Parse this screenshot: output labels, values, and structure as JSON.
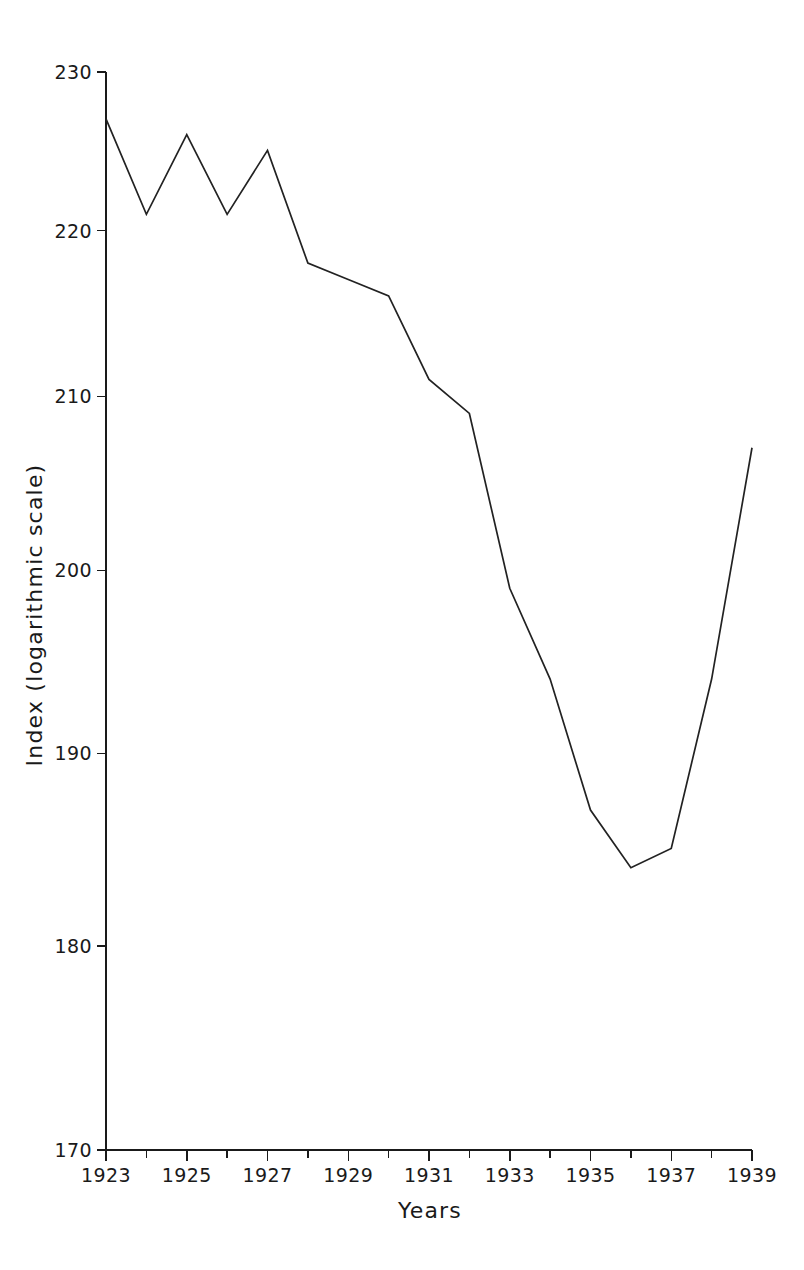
{
  "chart_data": {
    "type": "line",
    "title": "",
    "subtitle": "",
    "xlabel": "Years",
    "ylabel": "Index (logarithmic scale)",
    "yscale": "log",
    "xlim": [
      1923,
      1939
    ],
    "ylim": [
      170,
      230
    ],
    "grid": false,
    "legend": null,
    "x": [
      1923,
      1924,
      1925,
      1926,
      1927,
      1928,
      1929,
      1930,
      1931,
      1932,
      1933,
      1934,
      1935,
      1936,
      1937,
      1938,
      1939
    ],
    "values": [
      227,
      221,
      226,
      221,
      225,
      218,
      217,
      216,
      211,
      209,
      199,
      194,
      187,
      184,
      185,
      194,
      207
    ],
    "series": [
      {
        "name": "Index",
        "color": "#222222",
        "values": [
          227,
          221,
          226,
          221,
          225,
          218,
          217,
          216,
          211,
          209,
          199,
          194,
          187,
          184,
          185,
          194,
          207
        ]
      }
    ],
    "y_ticks": [
      170,
      180,
      190,
      200,
      210,
      220,
      230
    ],
    "y_tick_labels": [
      "170",
      "180",
      "190",
      "200",
      "210",
      "220",
      "230"
    ],
    "x_ticks": [
      1923,
      1924,
      1925,
      1926,
      1927,
      1928,
      1929,
      1930,
      1931,
      1932,
      1933,
      1934,
      1935,
      1936,
      1937,
      1938,
      1939
    ],
    "x_tick_labels": [
      "1923",
      "",
      "1925",
      "",
      "1927",
      "",
      "1929",
      "",
      "1931",
      "",
      "1933",
      "",
      "1935",
      "",
      "1937",
      "",
      "1939"
    ],
    "x_major_labels": [
      "1923",
      "1925",
      "1927",
      "1929",
      "1931",
      "1933",
      "1935",
      "1937",
      "1939"
    ]
  },
  "axes": {
    "x_title": "Years",
    "y_title": "Index (logarithmic scale)"
  },
  "colors": {
    "line": "#222222",
    "axis": "#1a1a1a",
    "background": "#ffffff"
  }
}
